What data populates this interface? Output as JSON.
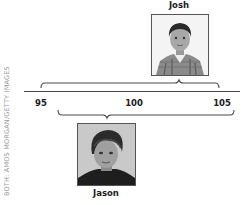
{
  "figure": {
    "type": "confidence-interval-diagram",
    "credit": "BOTH: AMOS MORGAN/GETTY IMAGES",
    "axis": {
      "ticks": [
        {
          "value": 95,
          "label": "95"
        },
        {
          "value": 100,
          "label": "100"
        },
        {
          "value": 105,
          "label": "105"
        }
      ]
    },
    "subjects": [
      {
        "name": "Josh",
        "position": "above",
        "score_estimate": 103.5,
        "interval": [
          95,
          110
        ]
      },
      {
        "name": "Jason",
        "position": "below",
        "score_estimate": 98,
        "interval": [
          96,
          106
        ]
      }
    ]
  },
  "colors": {
    "line": "#4a4a4a",
    "text": "#1a1a1a",
    "credit": "#9a9a9a",
    "photo_border": "#555555"
  }
}
